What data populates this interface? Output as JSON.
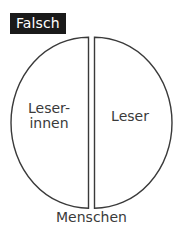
{
  "figure": {
    "name": "split-circle-diagram",
    "badge": {
      "label": "Falsch",
      "background": "#1a1a1a",
      "text_color": "#ffffff"
    },
    "circle": {
      "stroke": "#3a3a3a",
      "fill": "#ffffff",
      "divider_stroke": "#3a3a3a"
    },
    "segments": [
      {
        "id": "left-half",
        "label_line1": "Leser-",
        "label_line2": "innen"
      },
      {
        "id": "right-half",
        "label_line1": "Leser",
        "label_line2": ""
      }
    ],
    "caption": "Menschen"
  }
}
